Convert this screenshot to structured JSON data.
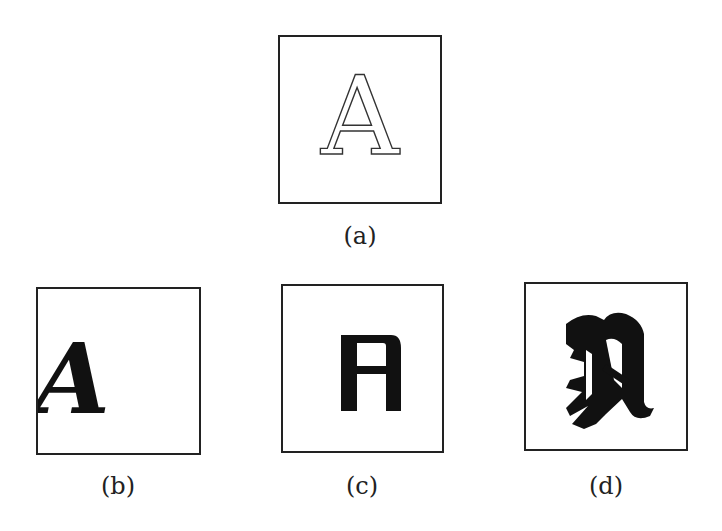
{
  "figure": {
    "panels": [
      {
        "id": "a",
        "caption": "(a)",
        "glyph": "A",
        "style": "outline serif"
      },
      {
        "id": "b",
        "caption": "(b)",
        "glyph": "A",
        "style": "italic serif, offset left"
      },
      {
        "id": "c",
        "caption": "(c)",
        "glyph": "A",
        "style": "bold block sans"
      },
      {
        "id": "d",
        "caption": "(d)",
        "glyph": "A",
        "style": "blackletter"
      }
    ]
  }
}
